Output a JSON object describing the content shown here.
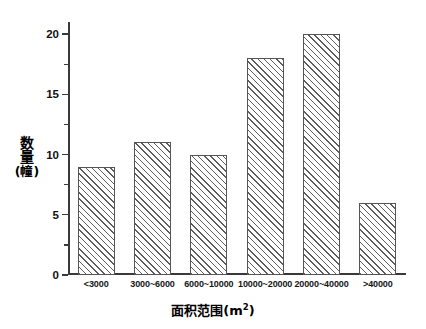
{
  "chart_data": {
    "type": "bar",
    "title": "",
    "subtitle": "",
    "categories": [
      "<3000",
      "3000~6000",
      "6000~10000",
      "10000~20000",
      "20000~40000",
      ">40000"
    ],
    "values": [
      9,
      11,
      10,
      18,
      20,
      6
    ],
    "xlabel_cjk": "面积范围",
    "xlabel_unit_open": "(m",
    "xlabel_unit_sup": "2",
    "xlabel_unit_close": ")",
    "xlabel": "面积范围(m2)",
    "ylabel_char1": "数",
    "ylabel_char2": "量",
    "ylabel_unit": "(幢)",
    "ylabel": "数量(幢)",
    "ylim": [
      0,
      21
    ],
    "xlim_note": "categorical",
    "y_ticks_major": [
      0,
      5,
      10,
      15,
      20
    ],
    "y_tick_labels": [
      "0",
      "5",
      "10",
      "15",
      "20"
    ],
    "y_ticks_minor": [
      2.5,
      7.5,
      12.5,
      17.5
    ],
    "grid": false,
    "legend": null,
    "bar_fill": "#ffffff",
    "bar_hatch": "diagonal-lines",
    "bar_edge_color": "#555555",
    "axis_color": "#3a3a3a",
    "background": "#ffffff"
  }
}
